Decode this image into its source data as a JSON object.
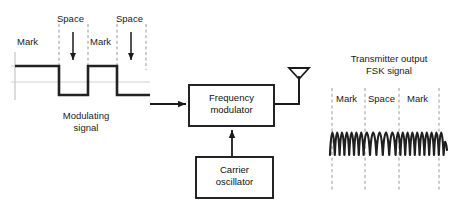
{
  "diagram": {
    "colors": {
      "ink": "#1a1a1a",
      "wave": "#222222",
      "axis": "#bfbfbf",
      "dash": "#9a9a9a",
      "background": "#ffffff"
    }
  },
  "modulating_signal": {
    "caption_line1": "Modulating",
    "caption_line2": "signal",
    "bit_labels": [
      {
        "text": "Mark",
        "x": 18,
        "y": 41
      },
      {
        "text": "Space",
        "x": 57,
        "y": 16
      },
      {
        "text": "Mark",
        "x": 92,
        "y": 41
      },
      {
        "text": "Space",
        "x": 126,
        "y": 16
      }
    ],
    "waveform": {
      "type": "square",
      "levels": [
        "high",
        "low",
        "high",
        "low"
      ],
      "level_names": [
        "Mark",
        "Space",
        "Mark",
        "Space"
      ]
    }
  },
  "blocks": {
    "modulator": {
      "line1": "Frequency",
      "line2": "modulator"
    },
    "oscillator": {
      "line1": "Carrier",
      "line2": "oscillator"
    }
  },
  "antenna": {
    "name": "antenna"
  },
  "fsk_output": {
    "caption_line1": "Transmitter output",
    "caption_line2": "FSK signal",
    "bit_labels": [
      {
        "text": "Mark",
        "x": 336,
        "y": 97
      },
      {
        "text": "Space",
        "x": 374,
        "y": 97
      },
      {
        "text": "Mark",
        "x": 414,
        "y": 97
      }
    ],
    "waveform": {
      "type": "sine-fsk",
      "segments": [
        {
          "label": "Mark",
          "cycles": 3.5,
          "relative_frequency": "high"
        },
        {
          "label": "Space",
          "cycles": 2.5,
          "relative_frequency": "low"
        },
        {
          "label": "Mark",
          "cycles": 3.5,
          "relative_frequency": "high"
        }
      ]
    }
  }
}
